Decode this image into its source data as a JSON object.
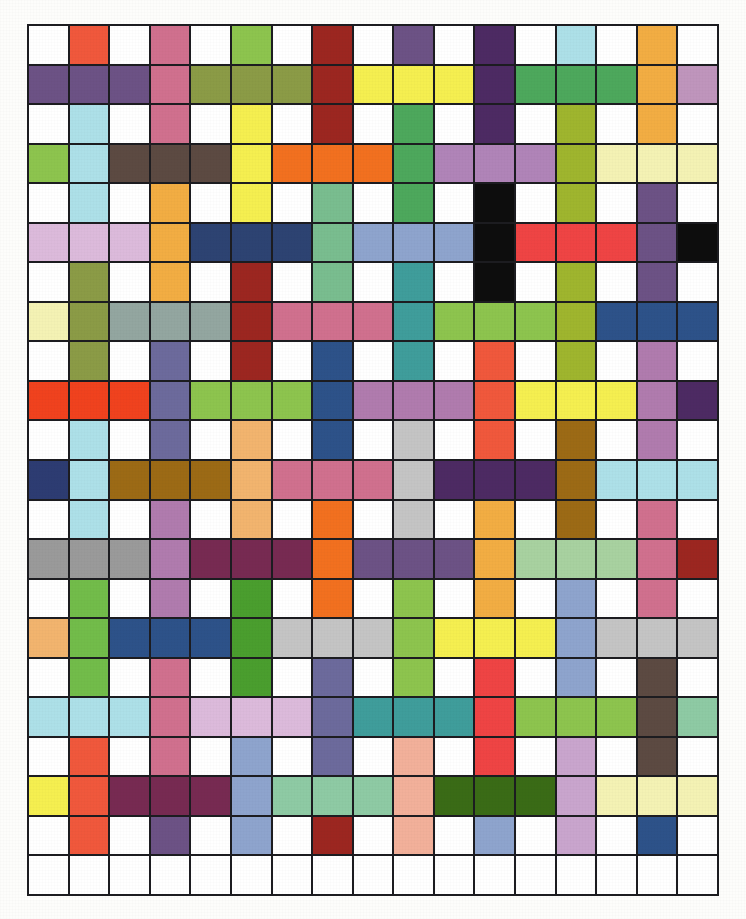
{
  "figure": {
    "type": "color-grid",
    "rows": 22,
    "columns": 17,
    "background": "#ffffff",
    "gridline_color": "#1c1c20",
    "margin_color": "#fdfdfb"
  },
  "chart_data": {
    "type": "heatmap",
    "title": "",
    "subtitle": "",
    "xlabel": "",
    "ylabel": "",
    "legend": [],
    "grid": true,
    "rows": 22,
    "columns": 17,
    "x": [
      1,
      2,
      3,
      4,
      5,
      6,
      7,
      8,
      9,
      10,
      11,
      12,
      13,
      14,
      15,
      16,
      17
    ],
    "y": [
      1,
      2,
      3,
      4,
      5,
      6,
      7,
      8,
      9,
      10,
      11,
      12,
      13,
      14,
      15,
      16,
      17,
      18,
      19,
      20,
      21,
      22
    ],
    "cell_colors": [
      [
        "#ffffff",
        "#f0583c",
        "#ffffff",
        "#d0708e",
        "#ffffff",
        "#8dc44e",
        "#ffffff",
        "#9c2620",
        "#ffffff",
        "#6c5285",
        "#ffffff",
        "#4d2a63",
        "#ffffff",
        "#ade0e8",
        "#ffffff",
        "#f2ad43",
        "#ffffff"
      ],
      [
        "#6c5285",
        "#6c5285",
        "#6c5285",
        "#d0708e",
        "#8b9b46",
        "#8b9b46",
        "#8b9b46",
        "#9c2620",
        "#f5ef50",
        "#f5ef50",
        "#f5ef50",
        "#4d2a63",
        "#4da85c",
        "#4da85c",
        "#4da85c",
        "#f2ad43",
        "#bf95bc"
      ],
      [
        "#ffffff",
        "#ade0e8",
        "#ffffff",
        "#d0708e",
        "#ffffff",
        "#f5ef50",
        "#ffffff",
        "#9c2620",
        "#ffffff",
        "#4da85c",
        "#ffffff",
        "#4d2a63",
        "#ffffff",
        "#9fb52e",
        "#ffffff",
        "#f2ad43",
        "#ffffff"
      ],
      [
        "#8dc44e",
        "#ade0e8",
        "#5c4a42",
        "#5c4a42",
        "#5c4a42",
        "#f5ef50",
        "#f2701f",
        "#f2701f",
        "#f2701f",
        "#4da85c",
        "#b084b8",
        "#b084b8",
        "#b084b8",
        "#9fb52e",
        "#f4f2b4",
        "#f4f2b4",
        "#f4f2b4"
      ],
      [
        "#ffffff",
        "#ade0e8",
        "#ffffff",
        "#f2ad43",
        "#ffffff",
        "#f5ef50",
        "#ffffff",
        "#79bd8f",
        "#ffffff",
        "#4da85c",
        "#ffffff",
        "#0d0d0d",
        "#ffffff",
        "#9fb52e",
        "#ffffff",
        "#6c5285",
        "#ffffff"
      ],
      [
        "#dcbadb",
        "#dcbadb",
        "#dcbadb",
        "#f2ad43",
        "#2d4372",
        "#2d4372",
        "#2d4372",
        "#79bd8f",
        "#8ea4cd",
        "#8ea4cd",
        "#8ea4cd",
        "#0d0d0d",
        "#ef4444",
        "#ef4444",
        "#ef4444",
        "#6c5285",
        "#0d0d0d"
      ],
      [
        "#ffffff",
        "#8b9b46",
        "#ffffff",
        "#f2ad43",
        "#ffffff",
        "#9c2620",
        "#ffffff",
        "#79bd8f",
        "#ffffff",
        "#3f9d9b",
        "#ffffff",
        "#0d0d0d",
        "#ffffff",
        "#9fb52e",
        "#ffffff",
        "#6c5285",
        "#ffffff"
      ],
      [
        "#f4f2b4",
        "#8b9b46",
        "#93a6a0",
        "#93a6a0",
        "#93a6a0",
        "#9c2620",
        "#d0708e",
        "#d0708e",
        "#d0708e",
        "#3f9d9b",
        "#8dc44e",
        "#8dc44e",
        "#8dc44e",
        "#9fb52e",
        "#2d5289",
        "#2d5289",
        "#2d5289"
      ],
      [
        "#ffffff",
        "#8b9b46",
        "#ffffff",
        "#6c6a9c",
        "#ffffff",
        "#9c2620",
        "#ffffff",
        "#2d5289",
        "#ffffff",
        "#3f9d9b",
        "#ffffff",
        "#f0583c",
        "#ffffff",
        "#9fb52e",
        "#ffffff",
        "#b07bae",
        "#ffffff"
      ],
      [
        "#f0421e",
        "#f0421e",
        "#f0421e",
        "#6c6a9c",
        "#8dc44e",
        "#8dc44e",
        "#8dc44e",
        "#2d5289",
        "#b07bae",
        "#b07bae",
        "#b07bae",
        "#f0583c",
        "#f5ef50",
        "#f5ef50",
        "#f5ef50",
        "#b07bae",
        "#4d2a63"
      ],
      [
        "#ffffff",
        "#ade0e8",
        "#ffffff",
        "#6c6a9c",
        "#ffffff",
        "#f2b46e",
        "#ffffff",
        "#2d5289",
        "#ffffff",
        "#c4c4c4",
        "#ffffff",
        "#f0583c",
        "#ffffff",
        "#9c6a15",
        "#ffffff",
        "#b07bae",
        "#ffffff"
      ],
      [
        "#2d3c72",
        "#ade0e8",
        "#9c6a15",
        "#9c6a15",
        "#9c6a15",
        "#f2b46e",
        "#d0708e",
        "#d0708e",
        "#d0708e",
        "#c4c4c4",
        "#4d2a63",
        "#4d2a63",
        "#4d2a63",
        "#9c6a15",
        "#ade0e8",
        "#ade0e8",
        "#ade0e8"
      ],
      [
        "#ffffff",
        "#ade0e8",
        "#ffffff",
        "#b07bae",
        "#ffffff",
        "#f2b46e",
        "#ffffff",
        "#f2701f",
        "#ffffff",
        "#c4c4c4",
        "#ffffff",
        "#f2ad43",
        "#ffffff",
        "#9c6a15",
        "#ffffff",
        "#d0708e",
        "#ffffff"
      ],
      [
        "#9a9a9a",
        "#9a9a9a",
        "#9a9a9a",
        "#b07bae",
        "#772a52",
        "#772a52",
        "#772a52",
        "#f2701f",
        "#6c5285",
        "#6c5285",
        "#6c5285",
        "#f2ad43",
        "#a8d1a0",
        "#a8d1a0",
        "#a8d1a0",
        "#d0708e",
        "#9c2620"
      ],
      [
        "#ffffff",
        "#72bc4a",
        "#ffffff",
        "#b07bae",
        "#ffffff",
        "#4a9e2e",
        "#ffffff",
        "#f2701f",
        "#ffffff",
        "#8dc44e",
        "#ffffff",
        "#f2ad43",
        "#ffffff",
        "#8ea4cd",
        "#ffffff",
        "#d0708e",
        "#ffffff"
      ],
      [
        "#f2b46e",
        "#72bc4a",
        "#2d5289",
        "#2d5289",
        "#2d5289",
        "#4a9e2e",
        "#c4c4c4",
        "#c4c4c4",
        "#c4c4c4",
        "#8dc44e",
        "#f5ef50",
        "#f5ef50",
        "#f5ef50",
        "#8ea4cd",
        "#c4c4c4",
        "#c4c4c4",
        "#c4c4c4"
      ],
      [
        "#ffffff",
        "#72bc4a",
        "#ffffff",
        "#d0708e",
        "#ffffff",
        "#4a9e2e",
        "#ffffff",
        "#6c6a9c",
        "#ffffff",
        "#8dc44e",
        "#ffffff",
        "#ef4444",
        "#ffffff",
        "#8ea4cd",
        "#ffffff",
        "#5c4a42",
        "#ffffff"
      ],
      [
        "#ade0e8",
        "#ade0e8",
        "#ade0e8",
        "#d0708e",
        "#dcbadb",
        "#dcbadb",
        "#dcbadb",
        "#6c6a9c",
        "#3f9d9b",
        "#3f9d9b",
        "#3f9d9b",
        "#ef4444",
        "#8dc44e",
        "#8dc44e",
        "#8dc44e",
        "#5c4a42",
        "#8ecaa4"
      ],
      [
        "#ffffff",
        "#f0583c",
        "#ffffff",
        "#d0708e",
        "#ffffff",
        "#8ea4cd",
        "#ffffff",
        "#6c6a9c",
        "#ffffff",
        "#f2b09a",
        "#ffffff",
        "#ef4444",
        "#ffffff",
        "#c9a5cd",
        "#ffffff",
        "#5c4a42",
        "#ffffff"
      ],
      [
        "#f5ef50",
        "#f0583c",
        "#772a52",
        "#772a52",
        "#772a52",
        "#8ea4cd",
        "#8ecaa4",
        "#8ecaa4",
        "#8ecaa4",
        "#f2b09a",
        "#3a6b16",
        "#3a6b16",
        "#3a6b16",
        "#c9a5cd",
        "#f4f2b4",
        "#f4f2b4",
        "#f4f2b4"
      ],
      [
        "#ffffff",
        "#f0583c",
        "#ffffff",
        "#6c5285",
        "#ffffff",
        "#8ea4cd",
        "#ffffff",
        "#9c2620",
        "#ffffff",
        "#f2b09a",
        "#ffffff",
        "#8ea4cd",
        "#ffffff",
        "#c9a5cd",
        "#ffffff",
        "#2d5289",
        "#ffffff"
      ],
      [
        "#ffffff",
        "#ffffff",
        "#ffffff",
        "#ffffff",
        "#ffffff",
        "#ffffff",
        "#ffffff",
        "#ffffff",
        "#ffffff",
        "#ffffff",
        "#ffffff",
        "#ffffff",
        "#ffffff",
        "#ffffff",
        "#ffffff",
        "#ffffff",
        "#ffffff"
      ]
    ]
  }
}
